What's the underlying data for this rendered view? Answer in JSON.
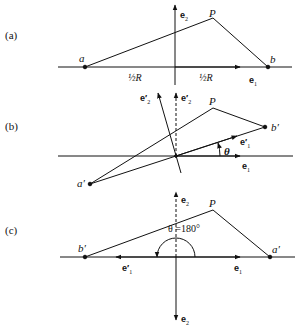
{
  "figure": {
    "panels": [
      {
        "id": "a",
        "label": "(a)",
        "points": {
          "a": "a",
          "b": "b",
          "P": "P"
        },
        "vectors": {
          "e1": "e",
          "e1_sub": "1",
          "e2": "e",
          "e2_sub": "2"
        },
        "half_R_left": "½R",
        "half_R_right": "½R"
      },
      {
        "id": "b",
        "label": "(b)",
        "points": {
          "a_prime": "a′",
          "b_prime": "b′",
          "P": "P"
        },
        "vectors": {
          "e1": "e",
          "e1_sub": "1",
          "e1_prime": "e′",
          "e1_prime_sub": "1",
          "e2_prime_rotated": "e′",
          "e2_prime_rotated_sub": "2",
          "e2_prime_dashed": "e′",
          "e2_prime_dashed_sub": "2"
        },
        "angle": "θ"
      },
      {
        "id": "c",
        "label": "(c)",
        "points": {
          "b_prime": "b′",
          "a_prime": "a′",
          "P": "P"
        },
        "vectors": {
          "e1": "e",
          "e1_sub": "1",
          "e1_prime": "e′",
          "e1_prime_sub": "1",
          "e2_up": "e",
          "e2_up_sub": "2",
          "e2_down": "e",
          "e2_down_sub": "2"
        },
        "angle": "θ =180°"
      }
    ],
    "colors": {
      "ink": "#111111",
      "background": "#ffffff"
    }
  }
}
